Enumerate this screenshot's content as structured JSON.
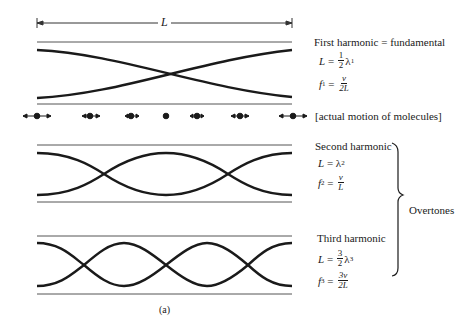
{
  "figure": {
    "label": "(a)",
    "length_symbol": "L",
    "line_color": "#1a1a1a",
    "rule_color": "#555555"
  },
  "harmonics": [
    {
      "title": "First harmonic  =  fundamental",
      "length_eq": {
        "lhs": "L",
        "coef_num": "1",
        "coef_den": "2",
        "lambda": "λ",
        "sub": "1"
      },
      "freq_eq": {
        "lhs": "f",
        "sub": "1",
        "num": "v",
        "den": "2L"
      },
      "loops": 1
    },
    {
      "title": "Second harmonic",
      "length_eq": {
        "lhs": "L",
        "lambda": "λ",
        "sub": "2"
      },
      "freq_eq": {
        "lhs": "f",
        "sub": "2",
        "num": "v",
        "den": "L"
      },
      "loops": 2
    },
    {
      "title": "Third harmonic",
      "length_eq": {
        "lhs": "L",
        "coef_num": "3",
        "coef_den": "2",
        "lambda": "λ",
        "sub": "3"
      },
      "freq_eq": {
        "lhs": "f",
        "sub": "3",
        "num": "3v",
        "den": "2L"
      },
      "loops": 3
    }
  ],
  "molecules": {
    "caption": "[actual motion of molecules]",
    "count": 7
  },
  "brace": {
    "label": "Overtones"
  }
}
